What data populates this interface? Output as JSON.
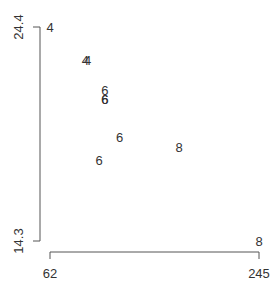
{
  "chart_data": {
    "type": "scatter",
    "title": "",
    "xlabel": "",
    "ylabel": "",
    "xlim": [
      62,
      245
    ],
    "ylim": [
      14.3,
      24.4
    ],
    "x_ticks": [
      "62",
      "245"
    ],
    "y_ticks": [
      "14.3",
      "24.4"
    ],
    "grid": false,
    "legend": null,
    "marker": "text labels (cylinder count)",
    "points": [
      {
        "x": 110,
        "y": 21.0,
        "label": "6"
      },
      {
        "x": 110,
        "y": 21.0,
        "label": "6"
      },
      {
        "x": 93,
        "y": 22.8,
        "label": "4"
      },
      {
        "x": 110,
        "y": 21.4,
        "label": "6"
      },
      {
        "x": 175,
        "y": 18.7,
        "label": "8"
      },
      {
        "x": 105,
        "y": 18.1,
        "label": "6"
      },
      {
        "x": 245,
        "y": 14.3,
        "label": "8"
      },
      {
        "x": 62,
        "y": 24.4,
        "label": "4"
      },
      {
        "x": 95,
        "y": 22.8,
        "label": "4"
      },
      {
        "x": 123,
        "y": 19.2,
        "label": "6"
      }
    ]
  },
  "axes": {
    "x_min_label": "62",
    "x_max_label": "245",
    "y_min_label": "14.3",
    "y_max_label": "24.4"
  },
  "colors": {
    "text": "#333333",
    "axis": "#555555",
    "background": "#ffffff"
  }
}
